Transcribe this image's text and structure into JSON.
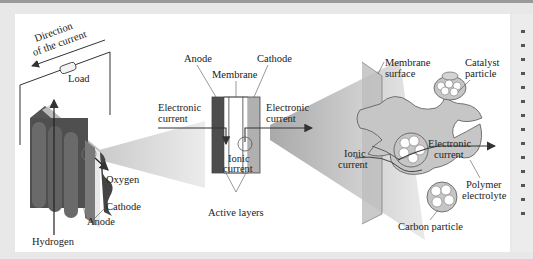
{
  "figure": {
    "colors": {
      "background": "#e8e8e8",
      "panel": "#ffffff",
      "stack_dark": "#4a4a4a",
      "stack_mid": "#6e6e6e",
      "anode": "#4d4d4d",
      "cathode": "#a8a8a8",
      "polymer": "#c4c4c4",
      "zoom_cone": "#d9d9d9",
      "arrow": "#333333"
    }
  },
  "stack_view": {
    "direction_label_line1": "Direction",
    "direction_label_line2": "of the current",
    "load_label": "Load",
    "oxygen_label": "Oxygen",
    "cathode_label": "Cathode",
    "anode_label": "Anode",
    "hydrogen_label": "Hydrogen"
  },
  "cell_view": {
    "anode_label": "Anode",
    "cathode_label": "Cathode",
    "membrane_label": "Membrane",
    "electronic_in_line1": "Electronic",
    "electronic_in_line2": "current",
    "electronic_out_line1": "Electronic",
    "electronic_out_line2": "current",
    "ionic_line1": "Ionic",
    "ionic_line2": "current",
    "active_layers_label": "Active layers"
  },
  "micro_view": {
    "membrane_surface_line1": "Membrane",
    "membrane_surface_line2": "surface",
    "catalyst_line1": "Catalyst",
    "catalyst_line2": "particle",
    "ionic_line1": "Ionic",
    "ionic_line2": "current",
    "electronic_line1": "Electronic",
    "electronic_line2": "current",
    "polymer_line1": "Polymer",
    "polymer_line2": "electrolyte",
    "carbon_label": "Carbon particle"
  }
}
